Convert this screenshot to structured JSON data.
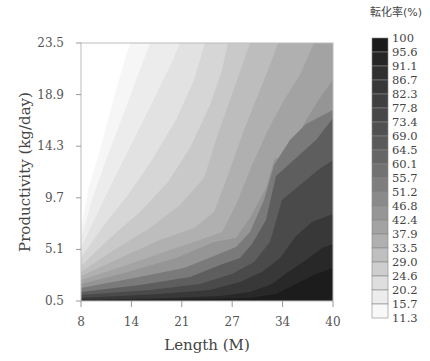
{
  "chart_data": {
    "type": "contour",
    "title": "",
    "xlabel": "Length (M)",
    "ylabel": "Productivity (kg/day)",
    "x_ticks": [
      "8",
      "14",
      "21",
      "27",
      "34",
      "40"
    ],
    "y_ticks": [
      "0.5",
      "5.1",
      "9.7",
      "14.3",
      "18.9",
      "23.5"
    ],
    "xlim": [
      8,
      40
    ],
    "ylim": [
      0.5,
      23.5
    ],
    "grid": false,
    "colorbar": {
      "title": "転化率(%)",
      "position": "right",
      "levels": [
        "100",
        "95.6",
        "91.1",
        "86.7",
        "82.3",
        "77.8",
        "73.4",
        "69.0",
        "64.5",
        "60.1",
        "55.7",
        "51.2",
        "46.8",
        "42.4",
        "37.9",
        "33.5",
        "29.0",
        "24.6",
        "20.2",
        "15.7",
        "11.3"
      ],
      "colors": [
        "#1a1a1a",
        "#262626",
        "#303030",
        "#383838",
        "#404040",
        "#474747",
        "#505050",
        "#5a5a5a",
        "#666666",
        "#727272",
        "#7e7e7e",
        "#8a8a8a",
        "#969696",
        "#a3a3a3",
        "#b0b0b0",
        "#bfbfbf",
        "#cecece",
        "#dedede",
        "#ececec",
        "#f8f8f8"
      ]
    }
  }
}
